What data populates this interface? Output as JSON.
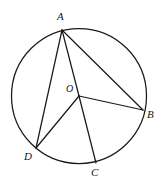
{
  "figure": {
    "kind": "circle-geometry-diagram",
    "stroke_color": "#1a1a1a",
    "background_color": "#ffffff",
    "label_color": "#151515"
  },
  "circle": {
    "name": "main-circle",
    "center_x": 79,
    "center_y": 96,
    "radius": 67.5
  },
  "points": [
    {
      "id": "A",
      "label": "A",
      "x": 62,
      "y": 30,
      "label_x": 57,
      "label_y": 11
    },
    {
      "id": "B",
      "label": "B",
      "x": 143,
      "y": 110,
      "label_x": 147,
      "label_y": 109
    },
    {
      "id": "C",
      "label": "C",
      "x": 96,
      "y": 163,
      "label_x": 91,
      "label_y": 167
    },
    {
      "id": "D",
      "label": "D",
      "x": 36,
      "y": 148,
      "label_x": 24,
      "label_y": 151
    },
    {
      "id": "O",
      "label": "O",
      "x": 79,
      "y": 96,
      "label_x": 66,
      "label_y": 83
    }
  ],
  "segments": [
    {
      "name": "chord-AD",
      "kind": "chord",
      "from": "A",
      "to": "D",
      "x1": 62,
      "y1": 30,
      "x2": 36,
      "y2": 148
    },
    {
      "name": "chord-AB",
      "kind": "chord",
      "from": "A",
      "to": "B",
      "x1": 62,
      "y1": 30,
      "x2": 143,
      "y2": 110
    },
    {
      "name": "radius-OA",
      "kind": "radius",
      "from": "O",
      "to": "A",
      "x1": 79,
      "y1": 96,
      "x2": 62,
      "y2": 30
    },
    {
      "name": "radius-OB",
      "kind": "radius",
      "from": "O",
      "to": "B",
      "x1": 79,
      "y1": 96,
      "x2": 143,
      "y2": 110
    },
    {
      "name": "radius-OC",
      "kind": "radius",
      "from": "O",
      "to": "C",
      "x1": 79,
      "y1": 96,
      "x2": 96,
      "y2": 163
    },
    {
      "name": "radius-OD",
      "kind": "radius",
      "from": "O",
      "to": "D",
      "x1": 79,
      "y1": 96,
      "x2": 36,
      "y2": 148
    }
  ]
}
